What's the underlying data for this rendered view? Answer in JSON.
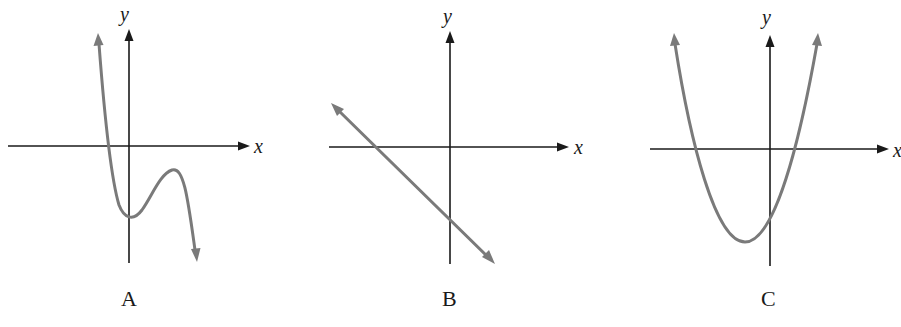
{
  "figure": {
    "graphs": [
      {
        "id": "A",
        "label": "A",
        "x_axis_label": "x",
        "y_axis_label": "y",
        "description": "cubic-like curve with negative leading coefficient",
        "curve_color": "#7a7a7a"
      },
      {
        "id": "B",
        "label": "B",
        "x_axis_label": "x",
        "y_axis_label": "y",
        "description": "straight line with negative slope and negative y-intercept",
        "curve_color": "#7a7a7a"
      },
      {
        "id": "C",
        "label": "C",
        "x_axis_label": "x",
        "y_axis_label": "y",
        "description": "upward-opening parabola with vertex in third quadrant",
        "curve_color": "#7a7a7a"
      }
    ],
    "axis_color": "#1a1a1a",
    "background": "#ffffff"
  }
}
